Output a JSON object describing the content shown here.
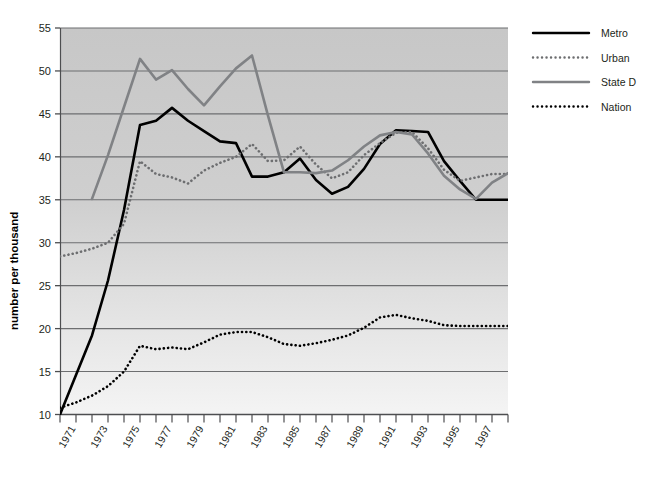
{
  "chart_data": {
    "type": "line",
    "title": "",
    "xlabel": "",
    "ylabel": "number per thousand",
    "ylim": [
      10,
      55
    ],
    "ytick_values": [
      10,
      15,
      20,
      25,
      30,
      35,
      40,
      45,
      50,
      55
    ],
    "xlim": [
      1970,
      1998
    ],
    "grid": true,
    "legend_position": "right",
    "x": [
      1970,
      1971,
      1972,
      1973,
      1974,
      1975,
      1976,
      1977,
      1978,
      1979,
      1980,
      1981,
      1982,
      1983,
      1984,
      1985,
      1986,
      1987,
      1988,
      1989,
      1990,
      1991,
      1992,
      1993,
      1994,
      1995,
      1996,
      1997,
      1998
    ],
    "xtick_labels": [
      "",
      "1971",
      "",
      "1973",
      "",
      "1975",
      "",
      "1977",
      "",
      "1979",
      "",
      "1981",
      "",
      "1983",
      "",
      "1985",
      "",
      "1987",
      "",
      "1989",
      "",
      "1991",
      "",
      "1993",
      "",
      "1995",
      "",
      "1997",
      ""
    ],
    "series": [
      {
        "name": "Metro",
        "color": "#000000",
        "style": "solid",
        "width": 2.6,
        "values": [
          10.0,
          14.6,
          19.2,
          25.6,
          33.8,
          43.7,
          44.2,
          45.7,
          44.2,
          43.0,
          41.8,
          41.6,
          37.7,
          37.7,
          38.2,
          39.8,
          37.3,
          35.7,
          36.5,
          38.6,
          41.5,
          43.1,
          43.0,
          42.9,
          39.5,
          37.2,
          35.0,
          35.0,
          35.0
        ]
      },
      {
        "name": "Urban",
        "color": "#6d6e70",
        "style": "dotted",
        "width": 2.6,
        "values": [
          28.4,
          28.8,
          29.3,
          30.0,
          32.2,
          39.5,
          38.0,
          37.6,
          36.9,
          38.4,
          39.3,
          40.0,
          41.5,
          39.5,
          39.6,
          41.2,
          39.1,
          37.5,
          38.2,
          40.2,
          41.6,
          42.8,
          42.9,
          41.0,
          38.5,
          37.2,
          37.6,
          38.0,
          38.0
        ]
      },
      {
        "name": "State D",
        "color": "#808285",
        "style": "solid",
        "width": 2.6,
        "values": [
          null,
          null,
          35.1,
          40.2,
          45.8,
          51.4,
          49.0,
          50.1,
          47.9,
          46.0,
          48.2,
          50.3,
          51.8,
          44.8,
          38.2,
          38.2,
          38.1,
          38.4,
          39.6,
          41.2,
          42.5,
          42.9,
          42.6,
          40.4,
          37.8,
          36.2,
          35.1,
          37.0,
          38.1
        ]
      },
      {
        "name": "Nation",
        "color": "#000000",
        "style": "dotted",
        "width": 2.6,
        "values": [
          10.8,
          11.4,
          12.2,
          13.3,
          15.0,
          18.0,
          17.6,
          17.8,
          17.6,
          18.4,
          19.3,
          19.6,
          19.6,
          19.0,
          18.2,
          18.0,
          18.3,
          18.7,
          19.2,
          20.1,
          21.3,
          21.6,
          21.2,
          20.9,
          20.4,
          20.3,
          20.3,
          20.3,
          20.3
        ]
      }
    ]
  },
  "legend": {
    "items": [
      {
        "label": "Metro"
      },
      {
        "label": "Urban"
      },
      {
        "label": "State D"
      },
      {
        "label": "Nation"
      }
    ]
  },
  "axes": {
    "y_title": "number per thousand"
  },
  "colors": {
    "plot_bg_top": "#c9c9c9",
    "plot_bg_bottom": "#f1f1f1",
    "gridline": "#6d6e70",
    "axis": "#58595b",
    "text": "#231f20"
  }
}
